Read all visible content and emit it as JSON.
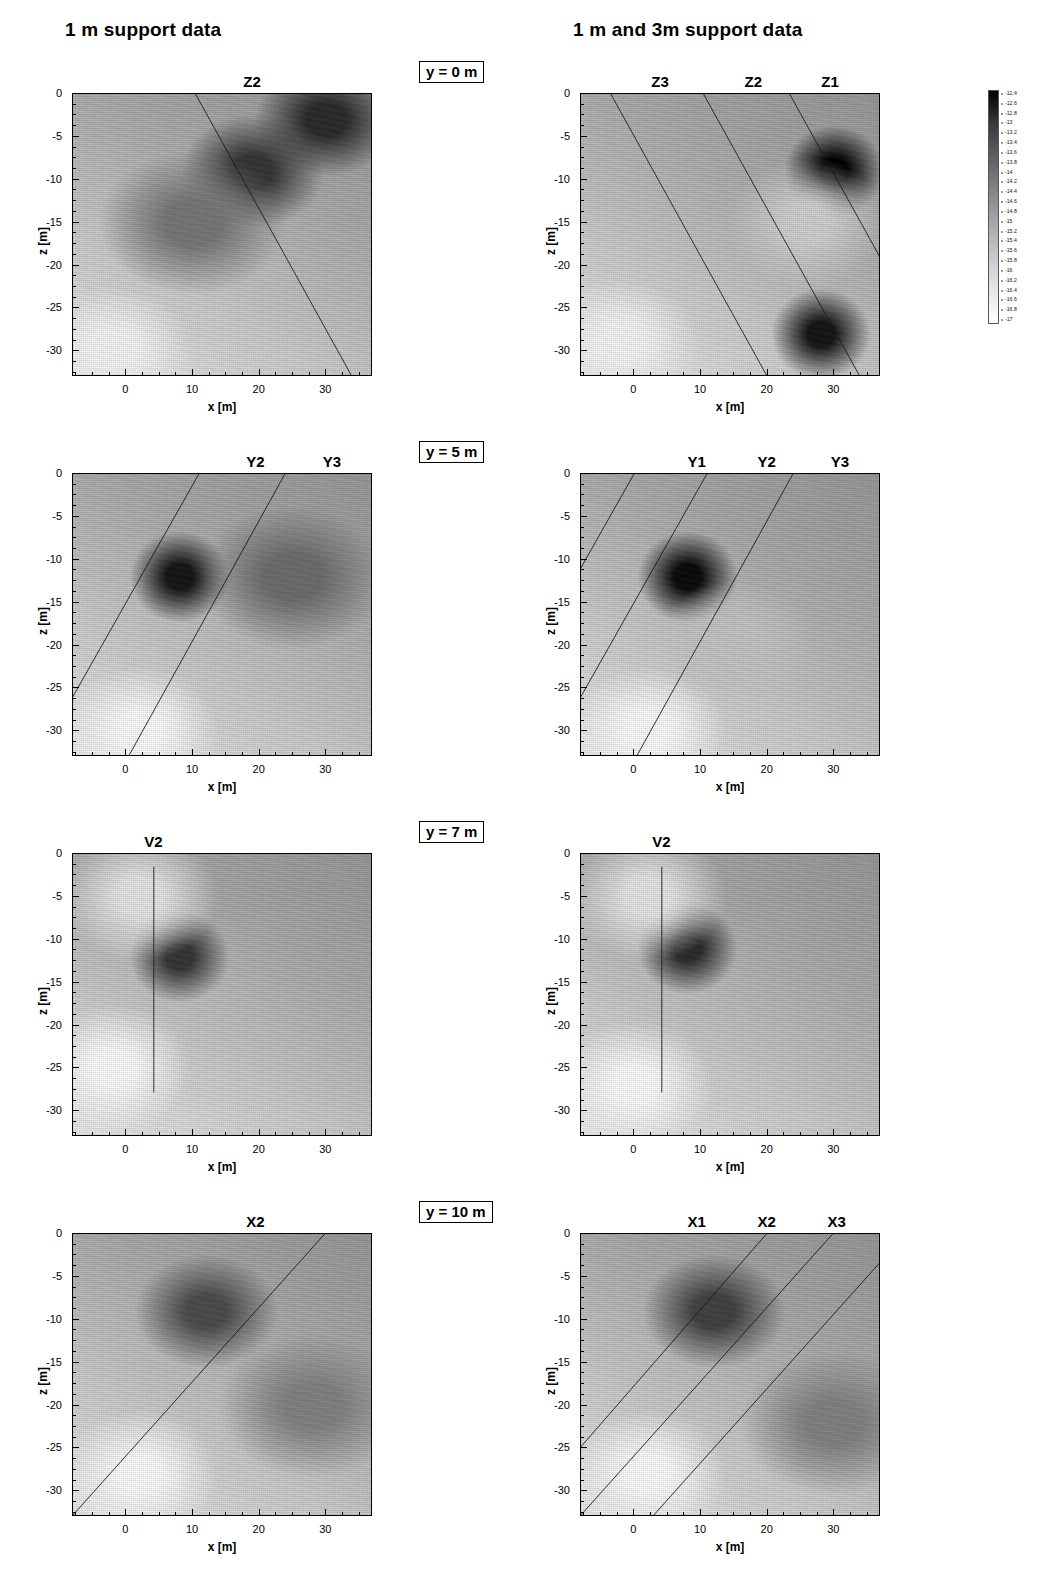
{
  "figure": {
    "columns": [
      {
        "id": "col-left",
        "header": "1 m support data"
      },
      {
        "id": "col-right",
        "header": "1 m and 3m support data"
      }
    ],
    "axes": {
      "x_title": "x [m]",
      "y_title": "z [m]",
      "x_ticks": [
        "0",
        "10",
        "20",
        "30"
      ],
      "x_tick_values": [
        0,
        10,
        20,
        30
      ],
      "x_range": [
        -8,
        37
      ],
      "y_ticks": [
        "0",
        "-5",
        "-10",
        "-15",
        "-20",
        "-25",
        "-30"
      ],
      "y_tick_values": [
        0,
        -5,
        -10,
        -15,
        -20,
        -25,
        -30
      ],
      "y_range": [
        -33,
        0
      ],
      "x_minor_step": 2.5,
      "y_minor_step": 1.25
    },
    "row_annotations": [
      {
        "label": "y = 0 m"
      },
      {
        "label": "y = 5 m"
      },
      {
        "label": "y = 7 m"
      },
      {
        "label": "y = 10 m"
      }
    ],
    "panels": [
      {
        "row": 0,
        "column": "left",
        "slice": "y = 0 m",
        "boreholes": [
          {
            "name": "Z2",
            "label_x": 19.0,
            "type": "inclined",
            "x_top": 10.5,
            "x_bottom": 34.0
          }
        ]
      },
      {
        "row": 0,
        "column": "right",
        "slice": "y = 0 m",
        "boreholes": [
          {
            "name": "Z3",
            "label_x": 4.0,
            "type": "inclined",
            "x_top": -3.5,
            "x_bottom": 20.0
          },
          {
            "name": "Z2",
            "label_x": 18.0,
            "type": "inclined",
            "x_top": 10.5,
            "x_bottom": 34.0
          },
          {
            "name": "Z1",
            "label_x": 29.5,
            "type": "inclined",
            "x_top": 23.5,
            "x_bottom": 47.0
          }
        ]
      },
      {
        "row": 1,
        "column": "left",
        "slice": "y = 5 m",
        "boreholes": [
          {
            "name": "Y2",
            "label_x": 19.5,
            "type": "inclined",
            "x_top": 11.0,
            "x_bottom": -13.0
          },
          {
            "name": "Y3",
            "label_x": 31.0,
            "type": "inclined",
            "x_top": 24.0,
            "x_bottom": 0.5
          }
        ]
      },
      {
        "row": 1,
        "column": "right",
        "slice": "y = 5 m",
        "boreholes": [
          {
            "name": "Y1",
            "label_x": 9.5,
            "type": "inclined",
            "x_top": 0.0,
            "x_bottom": -24.0
          },
          {
            "name": "Y2",
            "label_x": 20.0,
            "type": "inclined",
            "x_top": 11.0,
            "x_bottom": -13.0
          },
          {
            "name": "Y3",
            "label_x": 31.0,
            "type": "inclined",
            "x_top": 24.0,
            "x_bottom": 0.5
          }
        ]
      },
      {
        "row": 2,
        "column": "left",
        "slice": "y = 7 m",
        "boreholes": [
          {
            "name": "V2",
            "label_x": 4.2,
            "type": "vertical",
            "x": 4.2,
            "z_top": -1.5,
            "z_bottom": -28.0
          }
        ]
      },
      {
        "row": 2,
        "column": "right",
        "slice": "y = 7 m",
        "boreholes": [
          {
            "name": "V2",
            "label_x": 4.2,
            "type": "vertical",
            "x": 4.2,
            "z_top": -1.5,
            "z_bottom": -28.0
          }
        ]
      },
      {
        "row": 3,
        "column": "left",
        "slice": "y = 10 m",
        "boreholes": [
          {
            "name": "X2",
            "label_x": 19.5,
            "type": "inclined",
            "x_top": 30.0,
            "x_bottom": -8.0
          }
        ]
      },
      {
        "row": 3,
        "column": "right",
        "slice": "y = 10 m",
        "boreholes": [
          {
            "name": "X1",
            "label_x": 9.5,
            "type": "inclined",
            "x_top": 20.0,
            "x_bottom": -17.0
          },
          {
            "name": "X2",
            "label_x": 20.0,
            "type": "inclined",
            "x_top": 30.0,
            "x_bottom": -8.0
          },
          {
            "name": "X3",
            "label_x": 30.5,
            "type": "inclined",
            "x_top": 41.0,
            "x_bottom": 3.0
          }
        ]
      }
    ],
    "colorbar": {
      "orientation": "vertical",
      "max_label": "-12.4",
      "min_label": "-17",
      "max_value": -12.4,
      "min_value": -17,
      "step": 0.2,
      "high_color": "#000000",
      "low_color": "#ffffff",
      "ticks": [
        "-12.4",
        "-12.6",
        "-12.8",
        "-13",
        "-13.2",
        "-13.4",
        "-13.6",
        "-13.8",
        "-14",
        "-14.2",
        "-14.4",
        "-14.6",
        "-14.8",
        "-15",
        "-15.2",
        "-15.4",
        "-15.6",
        "-15.8",
        "-16",
        "-16.2",
        "-16.4",
        "-16.6",
        "-16.8",
        "-17"
      ],
      "tick_values": [
        -12.4,
        -12.6,
        -12.8,
        -13,
        -13.2,
        -13.4,
        -13.6,
        -13.8,
        -14,
        -14.2,
        -14.4,
        -14.6,
        -14.8,
        -15,
        -15.2,
        -15.4,
        -15.6,
        -15.8,
        -16,
        -16.2,
        -16.4,
        -16.6,
        -16.8,
        -17
      ]
    }
  },
  "chart_data": {
    "type": "heatmap",
    "title": "",
    "xlabel": "x [m]",
    "ylabel": "z [m]",
    "xlim": [
      -8,
      37
    ],
    "ylim": [
      -33,
      0
    ],
    "grid": false,
    "legend": "vertical colorbar, right of top-right panel",
    "colormap": "grayscale, dark = high (-12.4), light = low (-17)",
    "value_range": [
      -17,
      -12.4
    ],
    "contour_interval": 0.2,
    "panel_grid": {
      "rows": 4,
      "cols": 2
    },
    "column_titles": [
      "1 m support data",
      "1 m and 3m support data"
    ],
    "row_titles": [
      "y = 0 m",
      "y = 5 m",
      "y = 7 m",
      "y = 10 m"
    ],
    "panels": [
      {
        "name": "y0-1m",
        "row": 0,
        "col": 0,
        "overlays": [
          "Z2"
        ],
        "features": [
          {
            "kind": "low-value-lobe",
            "x": -2,
            "z": -30,
            "value": -16.9
          },
          {
            "kind": "high-value-lobe",
            "x": 30,
            "z": -3,
            "value": -13.2
          },
          {
            "kind": "high-value-lobe",
            "x": 19,
            "z": -9,
            "value": -13.4
          },
          {
            "kind": "mid-field",
            "x": 10,
            "z": -15,
            "value": -14.6
          }
        ]
      },
      {
        "name": "y0-1m3m",
        "row": 0,
        "col": 1,
        "overlays": [
          "Z3",
          "Z2",
          "Z1"
        ],
        "features": [
          {
            "kind": "high-value-core",
            "x": 30,
            "z": -9,
            "value": -12.4
          },
          {
            "kind": "high-value-core",
            "x": 28,
            "z": -28,
            "value": -12.8
          },
          {
            "kind": "low-value-lobe",
            "x": -2,
            "z": -29,
            "value": -16.9
          },
          {
            "kind": "low-value-lobe",
            "x": 26,
            "z": -15,
            "value": -16.2
          }
        ]
      },
      {
        "name": "y5-1m",
        "row": 1,
        "col": 0,
        "overlays": [
          "Y2",
          "Y3"
        ],
        "features": [
          {
            "kind": "high-value-core",
            "x": 8,
            "z": -12,
            "value": -12.8
          },
          {
            "kind": "low-value-lobe",
            "x": 2,
            "z": -30,
            "value": -17.0
          },
          {
            "kind": "mid-field",
            "x": 25,
            "z": -12,
            "value": -14.4
          }
        ]
      },
      {
        "name": "y5-1m3m",
        "row": 1,
        "col": 1,
        "overlays": [
          "Y1",
          "Y2",
          "Y3"
        ],
        "features": [
          {
            "kind": "high-value-core",
            "x": 8,
            "z": -12,
            "value": -12.6
          },
          {
            "kind": "low-value-lobe",
            "x": 2,
            "z": -30,
            "value": -17.0
          },
          {
            "kind": "low-value-lobe",
            "x": 15,
            "z": -20,
            "value": -16.0
          }
        ]
      },
      {
        "name": "y7-1m",
        "row": 2,
        "col": 0,
        "overlays": [
          "V2"
        ],
        "features": [
          {
            "kind": "high-value-core",
            "x": 8,
            "z": -12,
            "value": -13.4
          },
          {
            "kind": "low-value-lobe",
            "x": 2,
            "z": -5,
            "value": -16.6
          },
          {
            "kind": "low-value-lobe",
            "x": -2,
            "z": -25,
            "value": -17.0
          }
        ]
      },
      {
        "name": "y7-1m3m",
        "row": 2,
        "col": 1,
        "overlays": [
          "V2"
        ],
        "features": [
          {
            "kind": "high-value-core",
            "x": 8,
            "z": -11,
            "value": -13.2
          },
          {
            "kind": "low-value-lobe",
            "x": 2,
            "z": -5,
            "value": -16.6
          },
          {
            "kind": "low-value-lobe",
            "x": 0,
            "z": -27,
            "value": -17.0
          }
        ]
      },
      {
        "name": "y10-1m",
        "row": 3,
        "col": 0,
        "overlays": [
          "X2"
        ],
        "features": [
          {
            "kind": "high-value-lobe",
            "x": 12,
            "z": -9,
            "value": -13.8
          },
          {
            "kind": "low-value-lobe",
            "x": 2,
            "z": -28,
            "value": -17.0
          },
          {
            "kind": "mid-field",
            "x": 28,
            "z": -20,
            "value": -14.8
          }
        ]
      },
      {
        "name": "y10-1m3m",
        "row": 3,
        "col": 1,
        "overlays": [
          "X1",
          "X2",
          "X3"
        ],
        "features": [
          {
            "kind": "high-value-lobe",
            "x": 12,
            "z": -9,
            "value": -13.6
          },
          {
            "kind": "low-value-lobe",
            "x": 2,
            "z": -28,
            "value": -17.0
          },
          {
            "kind": "mid-field",
            "x": 30,
            "z": -22,
            "value": -14.8
          }
        ]
      }
    ]
  }
}
